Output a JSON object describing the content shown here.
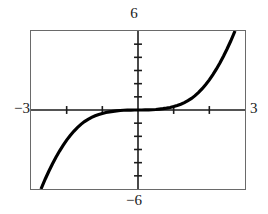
{
  "graph": {
    "ymax_label": "6",
    "ymin_label": "−6",
    "xmin_label": "−3",
    "xmax_label": "3",
    "window": {
      "xmin": -3,
      "xmax": 3,
      "ymin": -6,
      "ymax": 6,
      "xscl": 1,
      "yscl": 1
    },
    "frame_color": "#6a6a6a",
    "curve_color": "#000000",
    "axis_color": "#1a1a1a",
    "background_color": "#ffffff"
  },
  "chart_data": {
    "type": "line",
    "title": "",
    "xlabel": "",
    "ylabel": "",
    "xlim": [
      -3,
      3
    ],
    "ylim": [
      -6,
      6
    ],
    "grid": false,
    "legend": null,
    "axis_ticks": {
      "x": [
        -3,
        -2,
        -1,
        0,
        1,
        2,
        3
      ],
      "y": [
        -6,
        -5,
        -4,
        -3,
        -2,
        -1,
        0,
        1,
        2,
        3,
        4,
        5,
        6
      ]
    },
    "tick_labels": {
      "x_shown": [
        "−3",
        "3"
      ],
      "y_shown": [
        "6",
        "−6"
      ]
    },
    "annotations": [
      {
        "text": "6",
        "position": "top-center",
        "meaning": "y-axis maximum"
      },
      {
        "text": "−6",
        "position": "bottom-center",
        "meaning": "y-axis minimum"
      },
      {
        "text": "−3",
        "position": "left-middle",
        "meaning": "x-axis minimum"
      },
      {
        "text": "3",
        "position": "right-middle",
        "meaning": "x-axis maximum"
      }
    ],
    "series": [
      {
        "name": "curve",
        "description": "odd increasing curve through the origin, flat near x=0 and steep near the window edges",
        "x": [
          -2.72,
          -2.6,
          -2.5,
          -2.4,
          -2.3,
          -2.2,
          -2.1,
          -2.0,
          -1.9,
          -1.8,
          -1.7,
          -1.6,
          -1.5,
          -1.4,
          -1.3,
          -1.2,
          -1.1,
          -1.0,
          -0.9,
          -0.8,
          -0.7,
          -0.6,
          -0.5,
          -0.4,
          -0.3,
          -0.2,
          -0.1,
          0.0,
          0.1,
          0.2,
          0.3,
          0.4,
          0.5,
          0.6,
          0.7,
          0.8,
          0.9,
          1.0,
          1.1,
          1.2,
          1.3,
          1.4,
          1.5,
          1.6,
          1.7,
          1.8,
          1.9,
          2.0,
          2.1,
          2.2,
          2.3,
          2.4,
          2.5,
          2.6,
          2.72
        ],
        "y": [
          -6.0,
          -5.24,
          -4.65,
          -4.1,
          -3.59,
          -3.12,
          -2.69,
          -2.29,
          -1.94,
          -1.62,
          -1.34,
          -1.09,
          -0.88,
          -0.71,
          -0.56,
          -0.44,
          -0.34,
          -0.26,
          -0.19,
          -0.14,
          -0.1,
          -0.07,
          -0.04,
          -0.02,
          -0.01,
          -0.005,
          -0.001,
          0.0,
          0.001,
          0.005,
          0.01,
          0.02,
          0.04,
          0.07,
          0.1,
          0.14,
          0.19,
          0.26,
          0.34,
          0.44,
          0.56,
          0.71,
          0.88,
          1.09,
          1.34,
          1.62,
          1.94,
          2.29,
          2.69,
          3.12,
          3.59,
          4.1,
          4.65,
          5.24,
          6.0
        ]
      }
    ]
  }
}
